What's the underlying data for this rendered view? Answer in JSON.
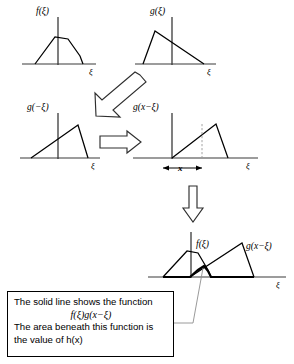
{
  "figure": {
    "kind": "convolution-illustration",
    "background": "#ffffff",
    "ink": "#000000"
  },
  "panels": {
    "f_top": {
      "label": "f(ξ)",
      "axis_label": "ξ",
      "shape": "trapezoid"
    },
    "g_top": {
      "label": "g(ξ)",
      "axis_label": "ξ",
      "shape": "triangle-steep-rise"
    },
    "g_reflected": {
      "label": "g(−ξ)",
      "axis_label": "ξ",
      "shape": "triangle-mirrored"
    },
    "g_shifted": {
      "label": "g(x−ξ)",
      "axis_label": "ξ",
      "shift_label": "x",
      "shape": "triangle-shifted-right"
    },
    "overlap": {
      "label_f": "f(ξ)",
      "label_g": "g(x−ξ)",
      "axis_label": "ξ"
    }
  },
  "arrows": {
    "diagonal": "hollow-arrow-down-left",
    "horizontal": "hollow-arrow-right",
    "vertical": "hollow-arrow-down"
  },
  "callout": {
    "line1": "The solid line shows the function",
    "formula": "f(ξ)g(x−ξ)",
    "line2": "The area beneath this function is",
    "line3": "the value of h(x)"
  }
}
